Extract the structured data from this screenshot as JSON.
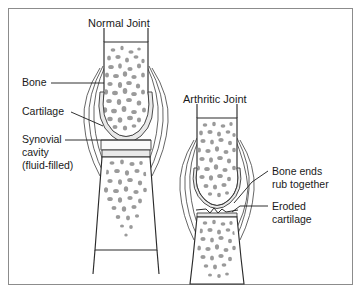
{
  "figure": {
    "background_color": "#ffffff",
    "border_color": "#8c8c8c",
    "ink_color": "#2b2b2b",
    "trabecula_color": "#9a9a9a",
    "cartilage_fill": "#e9e9e9"
  },
  "titles": {
    "normal": "Normal Joint",
    "arthritic": "Arthritic Joint"
  },
  "labels": {
    "bone": "Bone",
    "cartilage": "Cartilage",
    "synovial_line1": "Synovial",
    "synovial_line2": "cavity",
    "synovial_line3": "(fluid-filled)",
    "bone_ends_line1": "Bone ends",
    "bone_ends_line2": "rub together",
    "eroded_line1": "Eroded",
    "eroded_line2": "cartilage"
  },
  "diagram": {
    "type": "anatomical-cross-section",
    "panels": [
      {
        "name": "normal-joint",
        "features": [
          "upper bone",
          "lower bone",
          "cartilage cap",
          "synovial cavity",
          "joint capsule"
        ]
      },
      {
        "name": "arthritic-joint",
        "features": [
          "upper bone",
          "lower bone",
          "eroded cartilage",
          "bone ends contact",
          "joint capsule"
        ]
      }
    ]
  }
}
